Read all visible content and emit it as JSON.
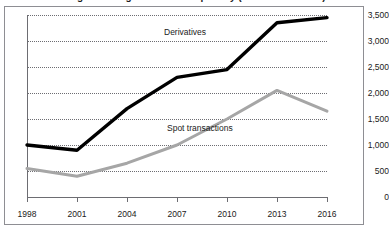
{
  "figure": {
    "title": "Number of foreign exchange transactions per day (billions of dollars)",
    "title_visible_note": "cropped"
  },
  "chart_data": {
    "type": "line",
    "title": "Number of foreign exchange transactions per day (billions of dollars)",
    "xlabel": "",
    "ylabel": "",
    "x": [
      "1998",
      "2001",
      "2004",
      "2007",
      "2010",
      "2013",
      "2016"
    ],
    "xtick_labels": [
      "1998",
      "2001",
      "2004",
      "2007",
      "2010",
      "2013",
      "2016"
    ],
    "ytick_labels": [
      "0",
      "500",
      "1,000",
      "1,500",
      "2,000",
      "2,500",
      "3,000",
      "3,500"
    ],
    "ytick_values": [
      0,
      500,
      1000,
      1500,
      2000,
      2500,
      3000,
      3500
    ],
    "ylim": [
      0,
      3500
    ],
    "grid": "horizontal-dotted",
    "y_axis_position": "right",
    "legend": "inline-labels",
    "series": [
      {
        "name": "Derivatives",
        "color": "#000000",
        "values": [
          1000,
          900,
          1700,
          2300,
          2450,
          3350,
          3450
        ]
      },
      {
        "name": "Spot transactions",
        "color": "#a6a6a6",
        "values": [
          550,
          400,
          650,
          1000,
          1500,
          2050,
          1650
        ]
      }
    ]
  },
  "labels": {
    "derivatives": "Derivatives",
    "spot": "Spot transactions"
  },
  "colors": {
    "derivatives": "#000000",
    "spot": "#a6a6a6",
    "axis": "#6d6d72",
    "grid": "#6d6d72",
    "frame": "#8e8e93",
    "text": "#1b1b1b"
  }
}
